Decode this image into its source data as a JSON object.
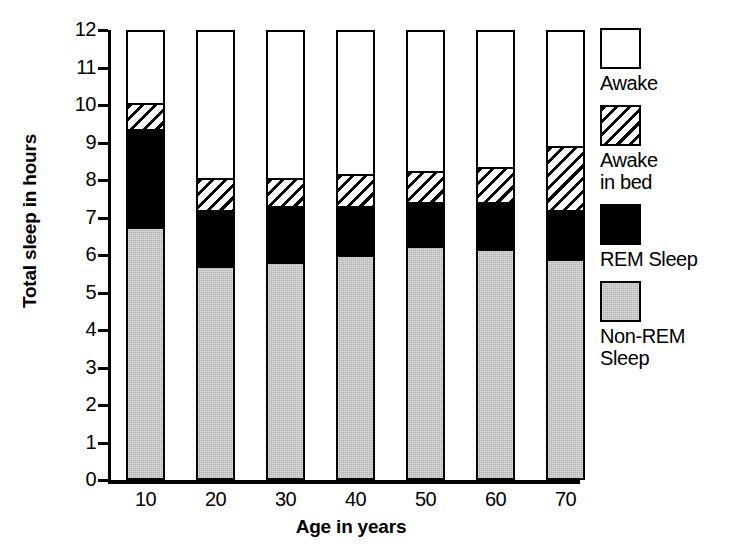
{
  "chart_data": {
    "type": "bar",
    "title": "",
    "subtitle": "",
    "xlabel": "Age in years",
    "ylabel": "Total sleep in hours",
    "categories": [
      "10",
      "20",
      "30",
      "40",
      "50",
      "60",
      "70"
    ],
    "ylim": [
      0,
      12
    ],
    "yticks": [
      "0",
      "1",
      "2",
      "3",
      "4",
      "5",
      "6",
      "7",
      "8",
      "9",
      "10",
      "11",
      "12"
    ],
    "grid": false,
    "stacked": true,
    "legend_position": "right",
    "series": [
      {
        "name": "Non-REM Sleep",
        "values": [
          6.7,
          5.65,
          5.75,
          5.95,
          6.2,
          6.1,
          5.85
        ]
      },
      {
        "name": "REM Sleep",
        "values": [
          2.55,
          1.45,
          1.45,
          1.25,
          1.1,
          1.2,
          1.25
        ]
      },
      {
        "name": "Awake in bed",
        "values": [
          0.75,
          0.9,
          0.8,
          0.9,
          0.9,
          1.0,
          1.75
        ]
      },
      {
        "name": "Awake",
        "values": [
          2.0,
          4.0,
          4.0,
          3.9,
          3.8,
          3.7,
          3.15
        ]
      }
    ],
    "cumulative_tops": {
      "nonrem": [
        6.7,
        5.65,
        5.75,
        5.95,
        6.2,
        6.1,
        5.85
      ],
      "rem": [
        9.25,
        7.1,
        7.2,
        7.2,
        7.3,
        7.3,
        7.1
      ],
      "awake_in_bed": [
        10.0,
        8.0,
        8.0,
        8.1,
        8.2,
        8.3,
        8.85
      ],
      "awake": [
        12,
        12,
        12,
        12,
        12,
        12,
        12
      ]
    }
  },
  "legend": {
    "items": [
      {
        "key": "awake",
        "label": "Awake"
      },
      {
        "key": "awake-in-bed",
        "label": "Awake\nin bed"
      },
      {
        "key": "rem",
        "label": "REM Sleep"
      },
      {
        "key": "non-rem",
        "label": "Non-REM\nSleep"
      }
    ]
  },
  "colors": {
    "non_rem": "#b3b3b3",
    "rem": "#000000",
    "awake_in_bed": "#ffffff",
    "awake": "#ffffff",
    "axis": "#000000",
    "background": "#ffffff"
  }
}
